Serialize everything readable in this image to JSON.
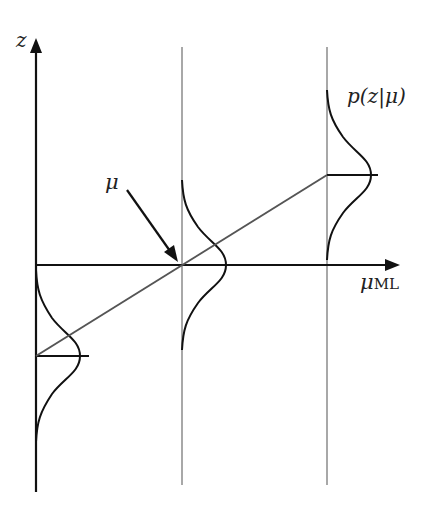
{
  "diagram": {
    "title": "",
    "labels": {
      "z_axis": "z",
      "x_axis_main": "μ",
      "x_axis_sub": "ML",
      "mu_pointer": "μ",
      "density": "p(z|μ)"
    },
    "colors": {
      "axis": "#111111",
      "grid": "#a8a8a8",
      "curve": "#111111",
      "line": "#555555"
    },
    "elements": [
      {
        "type": "axis",
        "name": "z",
        "direction": "vertical"
      },
      {
        "type": "axis",
        "name": "μ_ML",
        "direction": "horizontal"
      },
      {
        "type": "guide-line",
        "position": "μ_ML = 0"
      },
      {
        "type": "guide-line",
        "position": "μ_ML > 0"
      },
      {
        "type": "gaussian",
        "mean_position": "below axis",
        "at": "z-axis"
      },
      {
        "type": "gaussian",
        "mean_position": "on axis",
        "at": "middle guide"
      },
      {
        "type": "gaussian",
        "mean_position": "above axis",
        "at": "right guide"
      },
      {
        "type": "line",
        "description": "μ as linear function of μ_ML"
      }
    ]
  }
}
